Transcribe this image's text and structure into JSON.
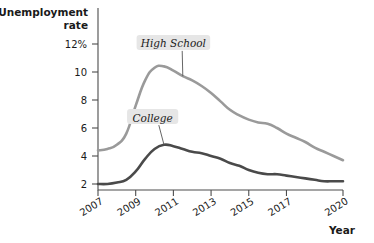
{
  "chart_data": {
    "type": "line",
    "title": "",
    "ylabel": "Unemployment rate",
    "xlabel": "Year",
    "ylim": [
      0,
      13
    ],
    "xlim": [
      2007,
      2020
    ],
    "grid": false,
    "legend_position": "inline-callout",
    "y_ticks": [
      {
        "value": 12,
        "label": "12%"
      },
      {
        "value": 10,
        "label": "10"
      },
      {
        "value": 8,
        "label": "8"
      },
      {
        "value": 6,
        "label": "6"
      },
      {
        "value": 4,
        "label": "4"
      },
      {
        "value": 2,
        "label": "2"
      }
    ],
    "x_ticks": [
      {
        "value": 2007,
        "label": "2007"
      },
      {
        "value": 2009,
        "label": "2009"
      },
      {
        "value": 2011,
        "label": "2011"
      },
      {
        "value": 2013,
        "label": "2013"
      },
      {
        "value": 2015,
        "label": "2015"
      },
      {
        "value": 2017,
        "label": "2017"
      },
      {
        "value": 2020,
        "label": "2020"
      }
    ],
    "x": [
      2007,
      2007.5,
      2008,
      2008.5,
      2009,
      2009.5,
      2010,
      2010.5,
      2011,
      2011.5,
      2012,
      2012.5,
      2013,
      2013.5,
      2014,
      2014.5,
      2015,
      2015.5,
      2016,
      2016.5,
      2017,
      2017.5,
      2018,
      2018.5,
      2019,
      2019.5,
      2020
    ],
    "series": [
      {
        "name": "High School",
        "color": "#9a9a9a",
        "stroke_width": 2.6,
        "label_x": 2011.0,
        "label_y": 11.9,
        "values": [
          4.4,
          4.5,
          4.8,
          5.6,
          7.6,
          9.4,
          10.3,
          10.4,
          10.1,
          9.7,
          9.4,
          9.0,
          8.5,
          7.9,
          7.3,
          6.9,
          6.6,
          6.4,
          6.3,
          6.0,
          5.6,
          5.3,
          5.0,
          4.6,
          4.3,
          4.0,
          3.7
        ]
      },
      {
        "name": "College",
        "color": "#4a4a4a",
        "stroke_width": 2.6,
        "label_x": 2009.9,
        "label_y": 6.6,
        "values": [
          2.0,
          2.0,
          2.1,
          2.3,
          2.9,
          3.8,
          4.5,
          4.8,
          4.7,
          4.5,
          4.3,
          4.2,
          4.0,
          3.8,
          3.5,
          3.3,
          3.0,
          2.8,
          2.7,
          2.7,
          2.6,
          2.5,
          2.4,
          2.3,
          2.2,
          2.2,
          2.2
        ]
      }
    ]
  },
  "axes": {
    "y_axis_title_line1": "Unemployment",
    "y_axis_title_line2": "rate",
    "x_axis_title": "Year"
  },
  "callouts": [
    {
      "name": "high-school",
      "text": "High School"
    },
    {
      "name": "college",
      "text": "College"
    }
  ]
}
